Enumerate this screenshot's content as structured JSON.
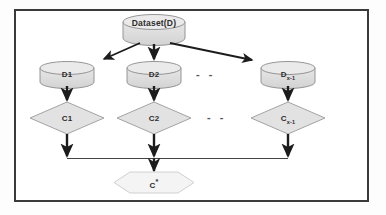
{
  "diagram": {
    "frame": {
      "border_color": "#3a3a3a",
      "background_color": "#ffffff"
    },
    "colors": {
      "cylinder_fill": "#dcdcdc",
      "cylinder_top_fill": "#e8e8e8",
      "cylinder_stroke": "#8a8a8a",
      "diamond_fill": "#e2e2e2",
      "diamond_stroke": "#9a9a9a",
      "hexagon_fill": "#f4f4f4",
      "hexagon_stroke": "#cfcfcf",
      "arrow_color": "#1c1c1c",
      "connector_color": "#2e2e2e",
      "text_color": "#2b2b2b"
    },
    "nodes": {
      "dataset": {
        "label": "Dataset(D)",
        "shape": "cylinder"
      },
      "partitions": [
        {
          "label": "D1",
          "base": "D",
          "subscript": "",
          "shape": "cylinder"
        },
        {
          "label": "D2",
          "base": "D",
          "subscript": "",
          "shape": "cylinder"
        },
        {
          "label": "Dx-1",
          "base": "D",
          "subscript": "x-1",
          "shape": "cylinder"
        }
      ],
      "clusterers": [
        {
          "label": "C1",
          "base": "C",
          "subscript": "",
          "shape": "diamond"
        },
        {
          "label": "C2",
          "base": "C",
          "subscript": "",
          "shape": "diamond"
        },
        {
          "label": "Cx-1",
          "base": "C",
          "subscript": "x-1",
          "shape": "diamond"
        }
      ],
      "final": {
        "label": "C*",
        "base": "C",
        "superscript": "*",
        "shape": "hexagon"
      }
    },
    "ellipsis": {
      "partition_row": "- -",
      "clusterer_row": "- -"
    },
    "edges": [
      {
        "from": "dataset",
        "to": "D1",
        "style": "arrow-diagonal"
      },
      {
        "from": "dataset",
        "to": "D2",
        "style": "arrow-vertical"
      },
      {
        "from": "dataset",
        "to": "Dx-1",
        "style": "arrow-diagonal"
      },
      {
        "from": "D1",
        "to": "C1",
        "style": "arrow-vertical"
      },
      {
        "from": "D2",
        "to": "C2",
        "style": "arrow-vertical"
      },
      {
        "from": "Dx-1",
        "to": "Cx-1",
        "style": "arrow-vertical"
      },
      {
        "from": "C1",
        "to": "merge-bus",
        "style": "arrow-vertical"
      },
      {
        "from": "C2",
        "to": "merge-bus",
        "style": "arrow-vertical"
      },
      {
        "from": "Cx-1",
        "to": "merge-bus",
        "style": "arrow-vertical"
      },
      {
        "from": "merge-bus",
        "to": "final",
        "style": "arrow-vertical"
      }
    ]
  }
}
